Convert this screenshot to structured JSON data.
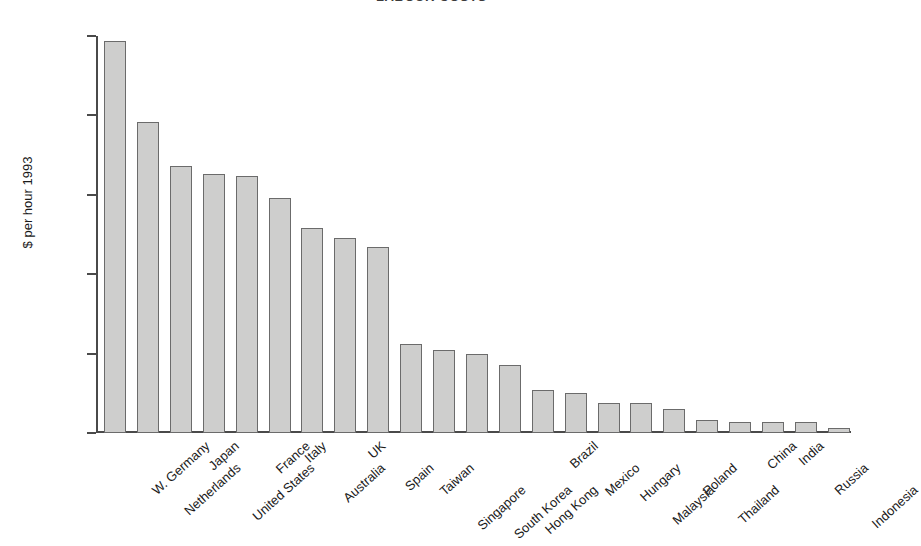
{
  "chart_data": {
    "type": "bar",
    "title": "LABOUR COSTS",
    "title_note": "top of title is cropped off by the screenshot edge",
    "xlabel": "",
    "ylabel": "$ per hour 1993",
    "ylim": [
      0,
      25
    ],
    "yticks": [
      0,
      5,
      10,
      15,
      20,
      25
    ],
    "ytick_labels": [
      "0",
      "5",
      "10",
      "15",
      "20",
      "25"
    ],
    "grid": false,
    "legend": false,
    "bar_fill_color": "#cececd",
    "bar_border_color": "#6b6b6b",
    "axis_color": "#4a4a4a",
    "background_color": "#ffffff",
    "categories": [
      "W. Germany",
      "Netherlands",
      "Japan",
      "United States",
      "France",
      "Italy",
      "Australia",
      "UK",
      "Spain",
      "Taiwan",
      "Singapore",
      "South Korea",
      "Hong Kong",
      "Brazil",
      "Mexico",
      "Hungary",
      "Malaysia",
      "Poland",
      "Thailand",
      "China",
      "India",
      "Russia",
      "Indonesia"
    ],
    "values": [
      24.7,
      19.6,
      16.8,
      16.3,
      16.2,
      14.8,
      12.9,
      12.3,
      11.7,
      5.6,
      5.2,
      5.0,
      4.3,
      2.7,
      2.5,
      1.9,
      1.9,
      1.5,
      0.8,
      0.7,
      0.7,
      0.7,
      0.3
    ],
    "label_stagger_rows": [
      0,
      1,
      0,
      1,
      0,
      0,
      1,
      0,
      1,
      1,
      2,
      2,
      2,
      0,
      1,
      1,
      2,
      1,
      2,
      0,
      0,
      1,
      2
    ]
  }
}
